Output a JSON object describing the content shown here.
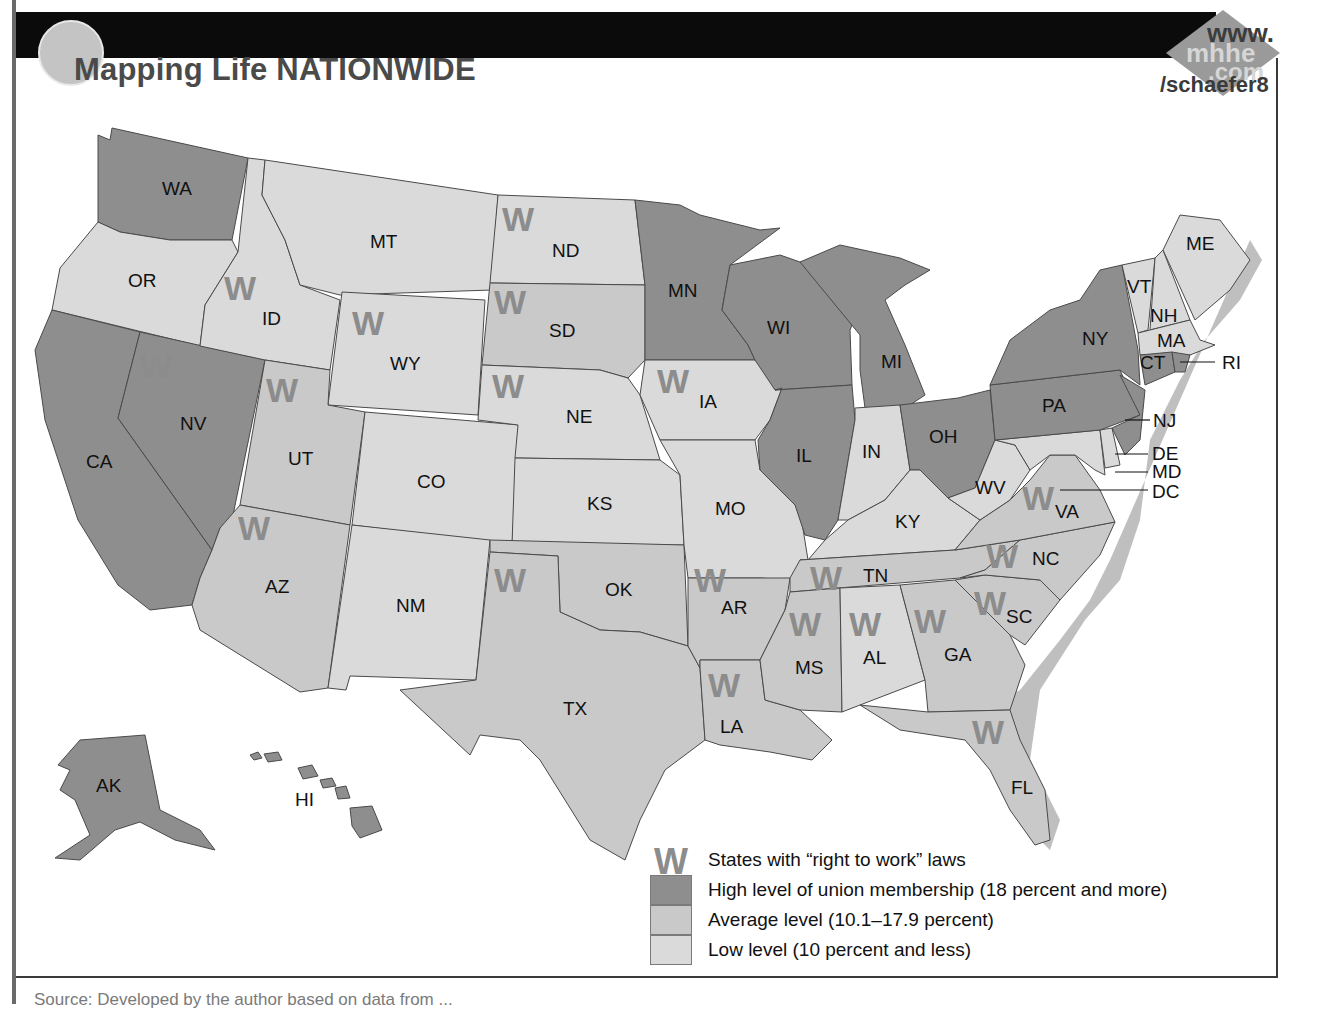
{
  "header": {
    "title": "Mapping Life NATIONWIDE",
    "web_badge": {
      "line1": "www.",
      "line2": "mhhe",
      "line3": ".com",
      "line4": "/schaefer8"
    }
  },
  "colors": {
    "high": "#8e8e8e",
    "average": "#c9c9c9",
    "low": "#dadada",
    "right_to_work_mark": "#8c8c8c",
    "top_bar": "#0b0b0b"
  },
  "legend": {
    "items": [
      {
        "symbol": "W",
        "label": "States with “right to work” laws"
      },
      {
        "swatch": "high",
        "label": "High level of union membership (18 percent and more)"
      },
      {
        "swatch": "average",
        "label": "Average level (10.1–17.9 percent)"
      },
      {
        "swatch": "low",
        "label": "Low level (10 percent and less)"
      }
    ]
  },
  "source": "Source: Developed by the author based on data from ...",
  "map": {
    "w_symbol": "W",
    "states": [
      {
        "abbr": "WA",
        "level": "high",
        "right_to_work": false
      },
      {
        "abbr": "OR",
        "level": "low",
        "right_to_work": false
      },
      {
        "abbr": "CA",
        "level": "high",
        "right_to_work": false
      },
      {
        "abbr": "NV",
        "level": "high",
        "right_to_work": true
      },
      {
        "abbr": "ID",
        "level": "low",
        "right_to_work": true
      },
      {
        "abbr": "MT",
        "level": "low",
        "right_to_work": false
      },
      {
        "abbr": "WY",
        "level": "low",
        "right_to_work": true
      },
      {
        "abbr": "UT",
        "level": "avg",
        "right_to_work": true
      },
      {
        "abbr": "AZ",
        "level": "avg",
        "right_to_work": true
      },
      {
        "abbr": "CO",
        "level": "low",
        "right_to_work": false
      },
      {
        "abbr": "NM",
        "level": "low",
        "right_to_work": false
      },
      {
        "abbr": "ND",
        "level": "low",
        "right_to_work": true
      },
      {
        "abbr": "SD",
        "level": "avg",
        "right_to_work": true
      },
      {
        "abbr": "NE",
        "level": "low",
        "right_to_work": true
      },
      {
        "abbr": "KS",
        "level": "low",
        "right_to_work": false
      },
      {
        "abbr": "OK",
        "level": "avg",
        "right_to_work": false
      },
      {
        "abbr": "TX",
        "level": "avg",
        "right_to_work": true
      },
      {
        "abbr": "MN",
        "level": "high",
        "right_to_work": false
      },
      {
        "abbr": "IA",
        "level": "low",
        "right_to_work": true
      },
      {
        "abbr": "MO",
        "level": "low",
        "right_to_work": false
      },
      {
        "abbr": "AR",
        "level": "avg",
        "right_to_work": true
      },
      {
        "abbr": "LA",
        "level": "avg",
        "right_to_work": true
      },
      {
        "abbr": "WI",
        "level": "high",
        "right_to_work": false
      },
      {
        "abbr": "IL",
        "level": "high",
        "right_to_work": false
      },
      {
        "abbr": "MI",
        "level": "high",
        "right_to_work": false
      },
      {
        "abbr": "IN",
        "level": "low",
        "right_to_work": false
      },
      {
        "abbr": "OH",
        "level": "high",
        "right_to_work": false
      },
      {
        "abbr": "KY",
        "level": "low",
        "right_to_work": false
      },
      {
        "abbr": "TN",
        "level": "avg",
        "right_to_work": true
      },
      {
        "abbr": "MS",
        "level": "avg",
        "right_to_work": true
      },
      {
        "abbr": "AL",
        "level": "low",
        "right_to_work": true
      },
      {
        "abbr": "GA",
        "level": "avg",
        "right_to_work": true
      },
      {
        "abbr": "FL",
        "level": "avg",
        "right_to_work": true
      },
      {
        "abbr": "SC",
        "level": "avg",
        "right_to_work": true
      },
      {
        "abbr": "NC",
        "level": "avg",
        "right_to_work": true
      },
      {
        "abbr": "VA",
        "level": "avg",
        "right_to_work": true
      },
      {
        "abbr": "WV",
        "level": "low",
        "right_to_work": false
      },
      {
        "abbr": "PA",
        "level": "high",
        "right_to_work": false
      },
      {
        "abbr": "NY",
        "level": "high",
        "right_to_work": false
      },
      {
        "abbr": "NJ",
        "level": "high",
        "right_to_work": false
      },
      {
        "abbr": "DE",
        "level": "low",
        "right_to_work": false
      },
      {
        "abbr": "MD",
        "level": "low",
        "right_to_work": false
      },
      {
        "abbr": "DC",
        "level": "low",
        "right_to_work": false
      },
      {
        "abbr": "VT",
        "level": "low",
        "right_to_work": false
      },
      {
        "abbr": "NH",
        "level": "low",
        "right_to_work": false
      },
      {
        "abbr": "ME",
        "level": "low",
        "right_to_work": false
      },
      {
        "abbr": "MA",
        "level": "low",
        "right_to_work": false
      },
      {
        "abbr": "CT",
        "level": "high",
        "right_to_work": false
      },
      {
        "abbr": "RI",
        "level": "high",
        "right_to_work": false
      },
      {
        "abbr": "AK",
        "level": "high",
        "right_to_work": false
      },
      {
        "abbr": "HI",
        "level": "high",
        "right_to_work": false
      }
    ]
  }
}
